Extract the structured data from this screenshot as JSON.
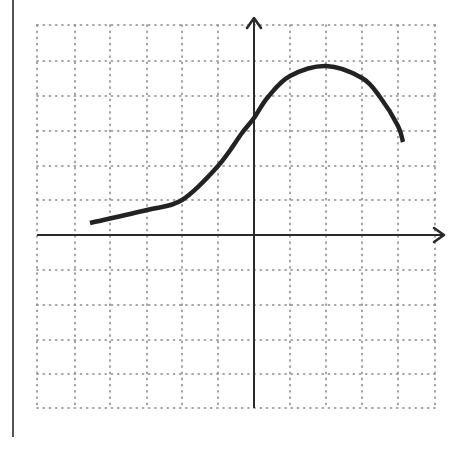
{
  "figure": {
    "background": "#ffffff",
    "grid_color": "#8a8a8a",
    "axis_color": "#2a2a2a",
    "curve_color": "#222222",
    "border_color": "#555555"
  },
  "layout": {
    "border_line": {
      "x": 13,
      "y1": 0,
      "y2": 437
    },
    "grid": {
      "left": 37,
      "right": 435,
      "top": 25,
      "bottom": 408,
      "vlines": [
        37,
        75,
        110,
        147,
        182,
        218,
        290,
        326,
        362,
        398,
        435
      ],
      "hlines": [
        25,
        61,
        96,
        131,
        166,
        200,
        270,
        305,
        340,
        374,
        408
      ]
    },
    "x_axis": {
      "y": 235,
      "x_start": 37,
      "x_end": 444
    },
    "y_axis": {
      "x": 254,
      "y_start": 408,
      "y_end": 18
    }
  },
  "chart_data": {
    "type": "line",
    "title": "",
    "xlabel": "",
    "ylabel": "",
    "grid": true,
    "units_per_square": 1,
    "xlim": [
      -6,
      5
    ],
    "ylim": [
      -5,
      6
    ],
    "series": [
      {
        "name": "f(x)",
        "x": [
          -4.7,
          -3,
          -2,
          -1,
          -0.33,
          0,
          0.4,
          1,
          2,
          3,
          3.5,
          4,
          4.15
        ],
        "y": [
          0.35,
          0.7,
          1.0,
          1.95,
          2.9,
          3.3,
          3.9,
          4.5,
          4.8,
          4.45,
          3.9,
          3.1,
          2.65
        ]
      }
    ],
    "pixel_path": [
      [
        90,
        223
      ],
      [
        147,
        210
      ],
      [
        182,
        200
      ],
      [
        218,
        166
      ],
      [
        242,
        133
      ],
      [
        254,
        118
      ],
      [
        268,
        97
      ],
      [
        290,
        76
      ],
      [
        326,
        66
      ],
      [
        362,
        78
      ],
      [
        380,
        97
      ],
      [
        398,
        126
      ],
      [
        403,
        142
      ]
    ]
  }
}
